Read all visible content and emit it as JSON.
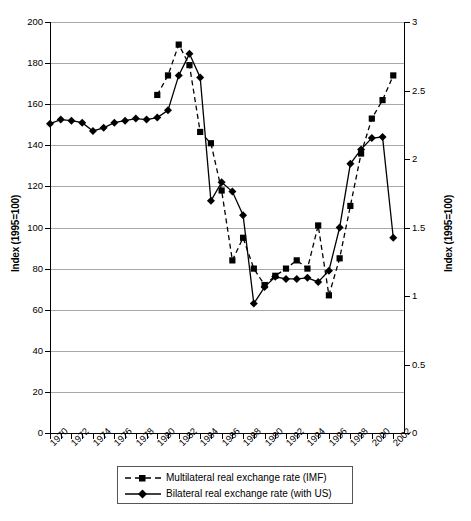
{
  "chart_data": {
    "type": "line",
    "title": "",
    "subtitle": "",
    "xlabel": "",
    "ylabel": "Index (1995=100)",
    "ylabel_right": "Index (1995=100)",
    "xlim": [
      1970,
      2003
    ],
    "ylim": [
      0,
      200
    ],
    "ylim_right": [
      0,
      3
    ],
    "ytick_labels": [
      "200",
      "180",
      "160",
      "140",
      "120",
      "100",
      "80",
      "60",
      "40",
      "20",
      "0"
    ],
    "ytick_values": [
      200,
      180,
      160,
      140,
      120,
      100,
      80,
      60,
      40,
      20,
      0
    ],
    "ytick_labels_right": [
      "3",
      "2.5",
      "2",
      "1.5",
      "1",
      "0.5",
      "0"
    ],
    "ytick_values_right": [
      3,
      2.5,
      2,
      1.5,
      1,
      0.5,
      0
    ],
    "xtick_labels": [
      "1970",
      "1972",
      "1974",
      "1976",
      "1978",
      "1980",
      "1982",
      "1984",
      "1986",
      "1988",
      "1990",
      "1992",
      "1994",
      "1996",
      "1998",
      "2000",
      "2002"
    ],
    "xtick_values": [
      1970,
      1972,
      1974,
      1976,
      1978,
      1980,
      1982,
      1984,
      1986,
      1988,
      1990,
      1992,
      1994,
      1996,
      1998,
      2000,
      2002
    ],
    "minor_xticks_every": 1,
    "grid": "horizontal",
    "legend_position": "below-axes",
    "series": [
      {
        "name": "Multilateral real exchange rate (IMF)",
        "axis": "left",
        "style": "dashed",
        "marker": "square",
        "color": "#000000",
        "x": [
          1980,
          1981,
          1982,
          1983,
          1984,
          1985,
          1986,
          1987,
          1988,
          1989,
          1990,
          1991,
          1992,
          1993,
          1994,
          1995,
          1996,
          1997,
          1998,
          1999,
          2000,
          2001,
          2002
        ],
        "values": [
          164.5,
          174,
          189,
          179,
          146.5,
          141,
          118,
          84,
          95,
          80,
          72,
          76.5,
          80,
          84,
          80,
          101,
          67,
          85,
          110.5,
          136,
          153,
          162,
          174
        ]
      },
      {
        "name": "Bilateral real exchange rate (with US)",
        "axis": "left",
        "style": "solid",
        "marker": "diamond",
        "color": "#000000",
        "x": [
          1970,
          1971,
          1972,
          1973,
          1974,
          1975,
          1976,
          1977,
          1978,
          1979,
          1980,
          1981,
          1982,
          1983,
          1984,
          1985,
          1986,
          1987,
          1988,
          1989,
          1990,
          1991,
          1992,
          1993,
          1994,
          1995,
          1996,
          1997,
          1998,
          1999,
          2000,
          2001,
          2002
        ],
        "values": [
          150.5,
          152.5,
          152,
          151,
          147,
          148.5,
          151,
          152,
          153,
          152.5,
          153.5,
          157,
          174,
          184.5,
          173,
          113,
          122,
          117.5,
          106,
          63,
          71,
          76,
          75,
          75,
          75.5,
          73.5,
          79,
          100,
          131,
          138,
          143.5,
          144,
          95
        ]
      }
    ],
    "annotations": []
  },
  "legend": {
    "items": [
      {
        "label": "Multilateral real exchange rate (IMF)",
        "style": "dashed",
        "marker": "square"
      },
      {
        "label": "Bilateral real exchange rate (with US)",
        "style": "solid",
        "marker": "diamond"
      }
    ]
  },
  "caption": ""
}
